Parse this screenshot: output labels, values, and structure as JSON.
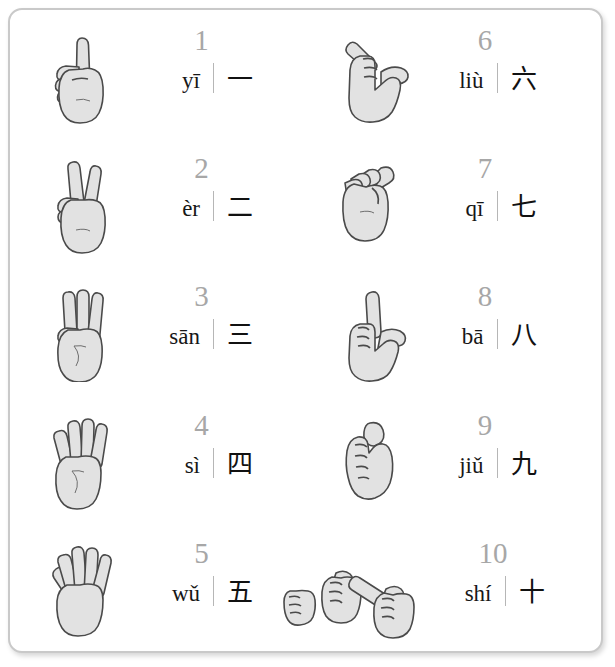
{
  "page": {
    "border_color": "#c9c9c9",
    "background_color": "#ffffff",
    "number_color": "#a7a7a7",
    "text_color": "#171717",
    "hand_fill": "#e2e2e2",
    "hand_stroke": "#4a4a4a"
  },
  "entries": [
    {
      "number": "1",
      "pinyin": "yī",
      "hanzi": "一",
      "sign": "index-finger-up-hand-sign",
      "column": 1,
      "row": 1
    },
    {
      "number": "2",
      "pinyin": "èr",
      "hanzi": "二",
      "sign": "two-fingers-up-hand-sign",
      "column": 1,
      "row": 2
    },
    {
      "number": "3",
      "pinyin": "sān",
      "hanzi": "三",
      "sign": "three-fingers-up-hand-sign",
      "column": 1,
      "row": 3
    },
    {
      "number": "4",
      "pinyin": "sì",
      "hanzi": "四",
      "sign": "four-fingers-up-hand-sign",
      "column": 1,
      "row": 4
    },
    {
      "number": "5",
      "pinyin": "wǔ",
      "hanzi": "五",
      "sign": "open-palm-five-hand-sign",
      "column": 1,
      "row": 5
    },
    {
      "number": "6",
      "pinyin": "liù",
      "hanzi": "六",
      "sign": "thumb-and-pinky-hand-sign",
      "column": 2,
      "row": 1
    },
    {
      "number": "7",
      "pinyin": "qī",
      "hanzi": "七",
      "sign": "pinched-fingertips-hand-sign",
      "column": 2,
      "row": 2
    },
    {
      "number": "8",
      "pinyin": "bā",
      "hanzi": "八",
      "sign": "thumb-and-index-hand-sign",
      "column": 2,
      "row": 3
    },
    {
      "number": "9",
      "pinyin": "jiǔ",
      "hanzi": "九",
      "sign": "hooked-index-finger-hand-sign",
      "column": 2,
      "row": 4
    },
    {
      "number": "10",
      "pinyin": "shí",
      "hanzi": "十",
      "sign": "crossed-index-fingers-hand-sign",
      "column": 2,
      "row": 5
    }
  ]
}
